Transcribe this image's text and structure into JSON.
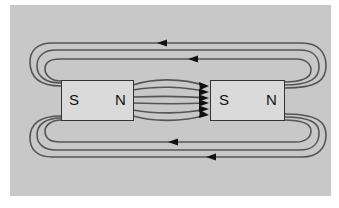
{
  "diagram": {
    "title": "",
    "colors": {
      "background": "#ffffff",
      "panel": "#c8c8c8",
      "magnet_fill": "#dadada",
      "field_line": "#555555",
      "arrow": "#111111"
    },
    "magnets": [
      {
        "id": "left",
        "left_pole": "S",
        "right_pole": "N"
      },
      {
        "id": "right",
        "left_pole": "S",
        "right_pole": "N"
      }
    ],
    "field_lines": {
      "top_loops": 3,
      "bottom_loops": 3,
      "center_lines": 6,
      "arrow_direction_outer": "left",
      "arrow_direction_center": "right"
    }
  }
}
